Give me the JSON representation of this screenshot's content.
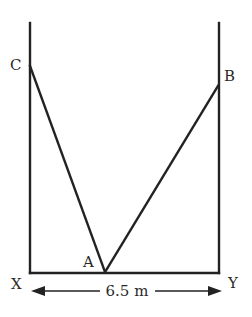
{
  "diagram": {
    "points": {
      "A": "A",
      "B": "B",
      "C": "C",
      "X": "X",
      "Y": "Y"
    },
    "dimension": {
      "label": "6.5 m",
      "from": "X",
      "to": "Y"
    },
    "segments": [
      {
        "name": "left-wall",
        "from": "X",
        "to": "C-wall-top"
      },
      {
        "name": "right-wall",
        "from": "Y",
        "to": "B-wall-top"
      },
      {
        "name": "floor",
        "from": "X",
        "to": "Y"
      },
      {
        "name": "ladder-AC",
        "from": "A",
        "to": "C"
      },
      {
        "name": "ladder-AB",
        "from": "A",
        "to": "B"
      }
    ]
  }
}
